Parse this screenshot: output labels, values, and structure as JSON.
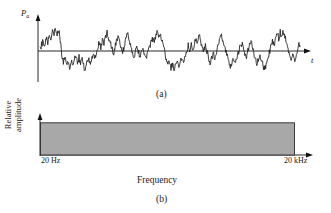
{
  "figure": {
    "panel_a": {
      "caption": "(a)",
      "y_axis_label": "P",
      "y_axis_label_sub": "a",
      "x_axis_label": "t"
    },
    "panel_b": {
      "caption": "(b)",
      "y_axis_label_line1": "Relative",
      "y_axis_label_line2": "amplitude",
      "x_axis_label": "Frequency",
      "x_tick_left": "20 Hz",
      "x_tick_right": "20 kHz"
    }
  },
  "colors": {
    "background": "#ffffff",
    "ink": "#1a1a1a",
    "axis": "#111111",
    "waveform": "#1c1c1c",
    "spectrum_fill": "#a8a8a8",
    "spectrum_stroke": "#2b2b2b"
  },
  "chart_data": [
    {
      "type": "line",
      "title": "(a)",
      "xlabel": "t",
      "ylabel": "Pa",
      "subtitle": "White noise: instantaneous acoustic pressure versus time",
      "grid": false,
      "legend": "none",
      "xlim": [
        0,
        100
      ],
      "ylim": [
        -1,
        1
      ],
      "x": [
        0,
        0.6,
        1.2,
        1.8,
        2.4,
        3.0,
        3.6,
        4.2,
        4.8,
        5.4,
        6.0,
        6.6,
        7.2,
        7.8,
        8.4,
        9.0,
        9.6,
        10.2,
        10.8,
        11.4,
        12.0,
        12.6,
        13.2,
        13.8,
        14.4,
        15.0,
        15.6,
        16.2,
        16.8,
        17.4,
        18.0,
        18.6,
        19.2,
        19.8,
        20.4,
        21.0,
        21.6,
        22.2,
        22.8,
        23.4,
        24.0,
        24.6,
        25.2,
        25.8,
        26.4,
        27.0,
        27.6,
        28.2,
        28.8,
        29.4,
        30.0,
        30.6,
        31.2,
        31.8,
        32.4,
        33.0,
        33.6,
        34.2,
        34.8,
        35.4,
        36.0,
        36.6,
        37.2,
        37.8,
        38.4,
        39.0,
        39.6,
        40.2,
        40.8,
        41.4,
        42.0,
        42.6,
        43.2,
        43.8,
        44.4,
        45.0,
        45.6,
        46.2,
        46.8,
        47.4,
        48.0,
        48.6,
        49.2,
        49.8,
        50.4,
        51.0,
        51.6,
        52.2,
        52.8,
        53.4,
        54.0,
        54.6,
        55.2,
        55.8,
        56.4,
        57.0,
        57.6,
        58.2,
        58.8,
        59.4,
        60.0,
        60.6,
        61.2,
        61.8,
        62.4,
        63.0,
        63.6,
        64.2,
        64.8,
        65.4,
        66.0,
        66.6,
        67.2,
        67.8,
        68.4,
        69.0,
        69.6,
        70.2,
        70.8,
        71.4,
        72.0,
        72.6,
        73.2,
        73.8,
        74.4,
        75.0,
        75.6,
        76.2,
        76.8,
        77.4,
        78.0,
        78.6,
        79.2,
        79.8,
        80.4,
        81.0,
        81.6,
        82.2,
        82.8,
        83.4,
        84.0,
        84.6,
        85.2,
        85.8,
        86.4,
        87.0,
        87.6,
        88.2,
        88.8,
        89.4,
        90.0,
        90.6,
        91.2,
        91.8,
        92.4,
        93.0,
        93.6,
        94.2,
        94.8,
        95.4,
        96.0,
        96.6,
        97.2,
        97.8,
        98.4,
        99.0,
        99.6,
        100.0
      ],
      "y": [
        0.02,
        0.2,
        0.33,
        0.21,
        0.4,
        0.3,
        0.52,
        0.46,
        0.68,
        0.55,
        0.74,
        0.6,
        0.72,
        0.3,
        -0.1,
        -0.34,
        -0.22,
        -0.46,
        -0.33,
        -0.52,
        -0.36,
        -0.5,
        -0.3,
        -0.18,
        -0.34,
        -0.22,
        -0.44,
        -0.3,
        -0.5,
        -0.62,
        -0.4,
        -0.26,
        -0.42,
        -0.28,
        -0.16,
        -0.3,
        -0.12,
        0.08,
        0.3,
        0.12,
        0.34,
        0.2,
        0.48,
        0.66,
        0.45,
        0.3,
        0.12,
        -0.14,
        0.1,
        0.32,
        0.5,
        0.34,
        0.16,
        -0.06,
        0.18,
        0.4,
        0.58,
        0.4,
        0.22,
        0.0,
        -0.2,
        -0.04,
        0.16,
        0.02,
        -0.18,
        -0.04,
        0.12,
        -0.08,
        -0.26,
        -0.1,
        0.06,
        0.26,
        0.44,
        0.28,
        0.48,
        0.62,
        0.44,
        0.58,
        0.4,
        0.2,
        -0.04,
        -0.3,
        -0.5,
        -0.35,
        -0.55,
        -0.42,
        -0.62,
        -0.48,
        -0.3,
        -0.5,
        -0.36,
        -0.18,
        -0.36,
        -0.2,
        0.0,
        0.2,
        0.04,
        0.22,
        0.06,
        0.28,
        0.46,
        0.3,
        0.5,
        0.34,
        0.18,
        -0.02,
        0.18,
        0.0,
        -0.2,
        -0.4,
        -0.24,
        -0.06,
        -0.26,
        -0.08,
        0.12,
        0.34,
        0.56,
        0.38,
        0.2,
        0.0,
        -0.2,
        -0.4,
        -0.58,
        -0.42,
        -0.24,
        -0.44,
        -0.26,
        -0.08,
        0.12,
        0.3,
        0.14,
        -0.04,
        -0.24,
        -0.06,
        0.14,
        0.32,
        0.16,
        -0.04,
        -0.26,
        -0.46,
        -0.3,
        -0.1,
        -0.3,
        -0.48,
        -0.62,
        -0.44,
        -0.26,
        -0.06,
        0.14,
        0.34,
        0.18,
        0.4,
        0.6,
        0.42,
        0.62,
        0.48,
        0.66,
        0.5,
        0.3,
        0.1,
        -0.12,
        -0.3,
        -0.14,
        -0.32,
        -0.16,
        0.04,
        0.24,
        0.1,
        0.3,
        0.14
      ]
    },
    {
      "type": "area",
      "title": "(b)",
      "xlabel": "Frequency",
      "ylabel": "Relative amplitude",
      "subtitle": "White noise: flat spectrum across the audio band",
      "grid": false,
      "legend": "none",
      "xticks": [
        "20 Hz",
        "20 kHz"
      ],
      "x": [
        20,
        20000
      ],
      "y": [
        1.0,
        1.0
      ],
      "xlim": [
        20,
        20000
      ],
      "ylim": [
        0,
        1.15
      ]
    }
  ]
}
